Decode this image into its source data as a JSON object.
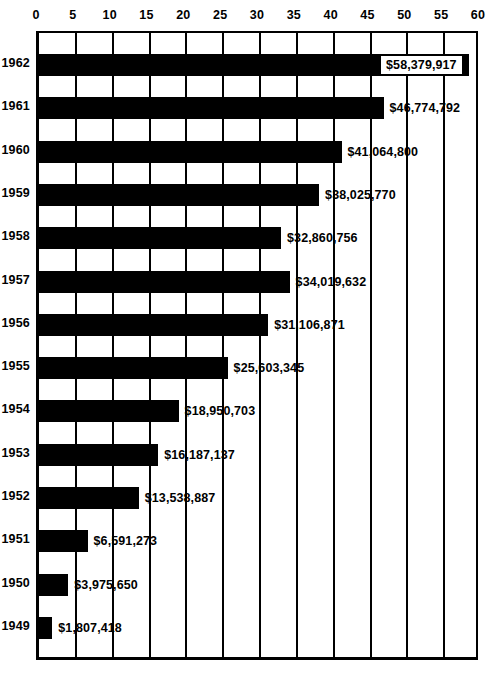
{
  "chart_data": {
    "type": "bar",
    "orientation": "horizontal",
    "title": "",
    "xlabel": "",
    "ylabel": "",
    "xlim": [
      0,
      60
    ],
    "xunit": "millions of dollars",
    "grid": true,
    "legend": null,
    "xticks": [
      0,
      5,
      10,
      15,
      20,
      25,
      30,
      35,
      40,
      45,
      50,
      55,
      60
    ],
    "xtick_labels": [
      "0",
      "5",
      "10",
      "15",
      "20",
      "25",
      "30",
      "35",
      "40",
      "45",
      "50",
      "55",
      "60"
    ],
    "categories": [
      "1962",
      "1961",
      "1960",
      "1959",
      "1958",
      "1957",
      "1956",
      "1955",
      "1954",
      "1953",
      "1952",
      "1951",
      "1950",
      "1949"
    ],
    "values": [
      58.379917,
      46.774792,
      41.0648,
      38.02577,
      32.860756,
      34.019632,
      31.106871,
      25.603345,
      18.950703,
      16.187137,
      13.538887,
      6.591273,
      3.97565,
      1.807418
    ],
    "data_labels": [
      "$58,379,917",
      "$46,774,792",
      "$41,064,800",
      "$38,025,770",
      "$32,860,756",
      "$34,019,632",
      "$31,106,871",
      "$25,603,345",
      "$18,950,703",
      "$16,187,137",
      "$13,538,887",
      "$6,591,273",
      "$3,975,650",
      "$1,807,418"
    ],
    "label_placement": [
      "inside",
      "outside",
      "outside",
      "outside",
      "outside",
      "outside",
      "outside",
      "outside",
      "outside",
      "outside",
      "outside",
      "outside",
      "outside",
      "outside"
    ],
    "bar_color": "#000000",
    "background_color": "#ffffff",
    "axis_color": "#000000"
  }
}
